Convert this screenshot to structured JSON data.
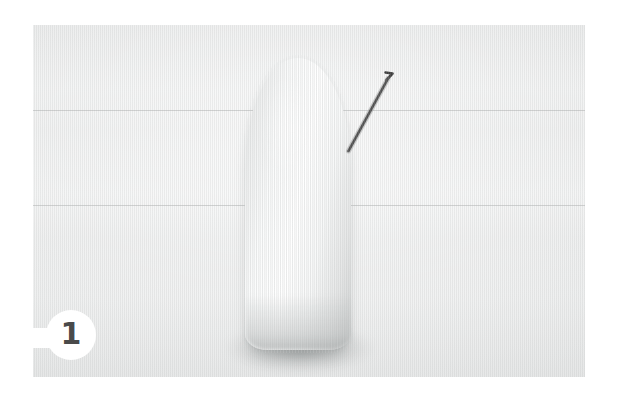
{
  "page": {
    "width": 624,
    "height": 400,
    "background_color": "#ffffff"
  },
  "photo": {
    "name": "instructional-step-photo",
    "backdrop_color": "#eceded",
    "bounds": {
      "x": 33,
      "y": 25,
      "width": 552,
      "height": 352
    },
    "description": "Close-up photograph of a white fuzzy wool roving cone standing upright on a pale grey paper backdrop, with a thin bent felting needle leaning against its right side."
  },
  "subject": {
    "name": "wool-roving-cone",
    "color": "#ffffff",
    "shadow_color": "#8c9090"
  },
  "tool": {
    "name": "felting-needle",
    "color": "#3c3c3c",
    "shape": "L-shaped bent barbed needle",
    "path": "M 315 126 L 355 53 L 360 48 L 353 47"
  },
  "badge": {
    "number": "1",
    "text_color": "#4a4a4a",
    "background_color": "#ffffff"
  }
}
